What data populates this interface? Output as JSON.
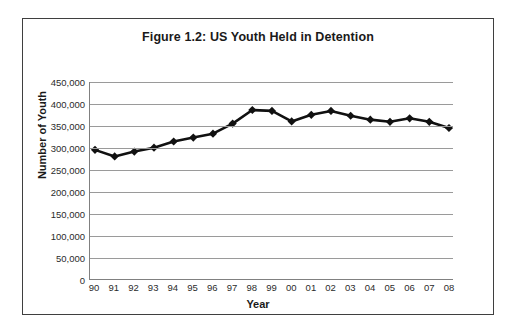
{
  "figure": {
    "title": "Figure 1.2: US Youth Held in Detention",
    "border_color": "#3f3f3f"
  },
  "chart_data": {
    "type": "line",
    "title": "Figure 1.2: US Youth Held in Detention",
    "xlabel": "Year",
    "ylabel": "Number of Youth",
    "categories": [
      "90",
      "91",
      "92",
      "93",
      "94",
      "95",
      "96",
      "97",
      "98",
      "99",
      "00",
      "01",
      "02",
      "03",
      "04",
      "05",
      "06",
      "07",
      "08"
    ],
    "values": [
      295000,
      280000,
      291000,
      300000,
      314000,
      323000,
      332000,
      355000,
      386000,
      384000,
      360000,
      375000,
      384000,
      373000,
      364000,
      359000,
      367000,
      359000,
      345000
    ],
    "series": [
      {
        "name": "Number of Youth",
        "values": [
          295000,
          280000,
          291000,
          300000,
          314000,
          323000,
          332000,
          355000,
          386000,
          384000,
          360000,
          375000,
          384000,
          373000,
          364000,
          359000,
          367000,
          359000,
          345000
        ],
        "color": "#111111",
        "marker": "diamond"
      }
    ],
    "ylim": [
      0,
      450000
    ],
    "ytick_values": [
      0,
      50000,
      100000,
      150000,
      200000,
      250000,
      300000,
      350000,
      400000,
      450000
    ],
    "ytick_labels": [
      "0",
      "50,000",
      "100,000",
      "150,000",
      "200,000",
      "250,000",
      "300,000",
      "350,000",
      "400,000",
      "450,000"
    ],
    "grid": "horizontal",
    "gridline_color": "#9a9a9a",
    "legend": "none",
    "line_color": "#111111",
    "line_width": 2.6
  }
}
